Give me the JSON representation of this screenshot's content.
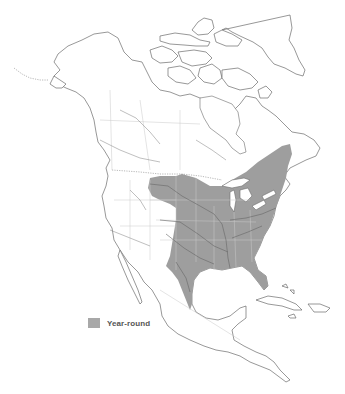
{
  "map": {
    "region": "North America",
    "range_color": "#9e9e9e",
    "coast_color": "#6b6b6b",
    "background": "#ffffff"
  },
  "legend": {
    "items": [
      {
        "label": "Year-round",
        "color": "#a8a8a8"
      }
    ]
  }
}
